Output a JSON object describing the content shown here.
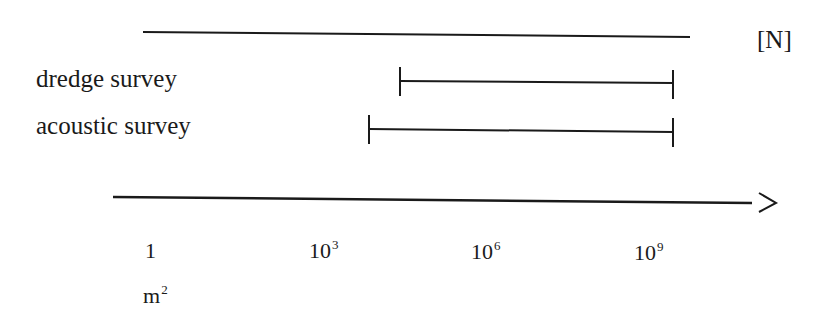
{
  "unit_bracket": "[N]",
  "rows": [
    {
      "label": "dredge survey",
      "range_from": "10^3.5",
      "range_to": "10^9.3"
    },
    {
      "label": "acoustic survey",
      "range_from": "10^2.9",
      "range_to": "10^9.3"
    }
  ],
  "axis": {
    "ticks": [
      {
        "base": "1",
        "exp": ""
      },
      {
        "base": "10",
        "exp": "3"
      },
      {
        "base": "10",
        "exp": "6"
      },
      {
        "base": "10",
        "exp": "9"
      }
    ],
    "unit_base": "m",
    "unit_exp": "2",
    "arrow": ">"
  },
  "colors": {
    "line": "#1a1a1a",
    "background": "#ffffff"
  }
}
